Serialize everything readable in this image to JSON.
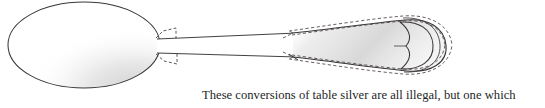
{
  "page": {
    "width": 545,
    "height": 108,
    "background_color": "#ffffff"
  },
  "caption": {
    "text": "These conversions of table silver are all illegal, but one which",
    "color": "#241f1f"
  },
  "illustration": {
    "subject": "spoon-line-drawing",
    "description": "Technical line drawing of a table spoon shown in profile: oval bowl at left, narrow tapering stem, broad flat handle at right terminating in a rounded bulb with a heart-shaped cleft. Dashed construction outlines overlay the handle and the bowl-to-stem junction.",
    "ink_color": "#2b2b2b",
    "outline_color": "#3a3638",
    "shading_color": "#d8d8d8",
    "shading_color_light": "#ebebeb",
    "dash_color": "#4a4446",
    "parts": [
      {
        "name": "bowl",
        "label": "spoon-bowl"
      },
      {
        "name": "neck",
        "label": "bowl-stem-junction"
      },
      {
        "name": "stem",
        "label": "spoon-stem"
      },
      {
        "name": "handle",
        "label": "spoon-handle"
      },
      {
        "name": "handle_tip",
        "label": "handle-heart-terminal"
      },
      {
        "name": "dashed_overlay",
        "label": "dashed-construction-lines"
      }
    ]
  }
}
